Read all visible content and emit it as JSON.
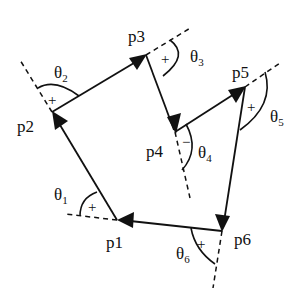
{
  "diagram": {
    "points": [
      {
        "id": "p1",
        "label": "p1",
        "x": 117,
        "y": 220
      },
      {
        "id": "p2",
        "label": "p2",
        "x": 52,
        "y": 112
      },
      {
        "id": "p3",
        "label": "p3",
        "x": 146,
        "y": 55
      },
      {
        "id": "p4",
        "label": "p4",
        "x": 175,
        "y": 132
      },
      {
        "id": "p5",
        "label": "p5",
        "x": 245,
        "y": 87
      },
      {
        "id": "p6",
        "label": "p6",
        "x": 222,
        "y": 231
      }
    ],
    "angles": [
      {
        "id": "theta1",
        "symbol": "θ",
        "sub": "1",
        "sign": "+"
      },
      {
        "id": "theta2",
        "symbol": "θ",
        "sub": "2",
        "sign": "+"
      },
      {
        "id": "theta3",
        "symbol": "θ",
        "sub": "3",
        "sign": "+"
      },
      {
        "id": "theta4",
        "symbol": "θ",
        "sub": "4",
        "sign": "−"
      },
      {
        "id": "theta5",
        "symbol": "θ",
        "sub": "5",
        "sign": "+"
      },
      {
        "id": "theta6",
        "symbol": "θ",
        "sub": "6",
        "sign": "+"
      }
    ]
  }
}
